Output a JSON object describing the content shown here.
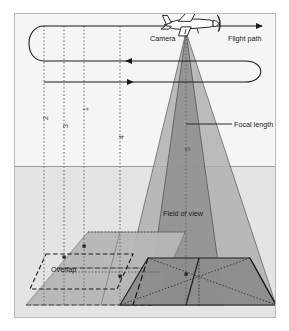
{
  "figure": {
    "type": "aerial-photogrammetry-diagram",
    "title_visible": false,
    "frame": {
      "border_color": "#b9b9b9",
      "background": "#f7f7f7"
    }
  },
  "labels": {
    "camera": "Camera",
    "flight_path": "Flight path",
    "focal_length": "Focal length",
    "field_of_view": "Field of view",
    "overlap": "Overlap"
  },
  "callout_numbers": {
    "one": "1",
    "two": "2",
    "three": "3",
    "four": "4",
    "five": "5"
  },
  "icons": {
    "airplane": "airplane-icon",
    "arrow_right": "arrow-right-icon",
    "arrow_left": "arrow-left-icon",
    "ground_point": "ground-point-marker-icon"
  },
  "colors": {
    "sky": "#f2f2f2",
    "ground": "#e3e3e3",
    "cone_light": "#a9a9a9",
    "cone_dark": "#8e8e8e",
    "footprint_light": "#b4b4b4",
    "footprint_dark": "#8a8a8a",
    "line": "#1a1a1a",
    "frame": "#b9b9b9",
    "dotted": "#6e6e6e"
  },
  "geometry": {
    "horizon_y": 166,
    "camera_apex": {
      "x": 186,
      "y": 32
    },
    "frame_rect": {
      "x": 14,
      "y": 13,
      "w": 262,
      "h": 305
    },
    "vertical_dotted_x": [
      44,
      64,
      84,
      120,
      186
    ],
    "flight_lines_y": [
      26,
      61,
      82
    ]
  }
}
